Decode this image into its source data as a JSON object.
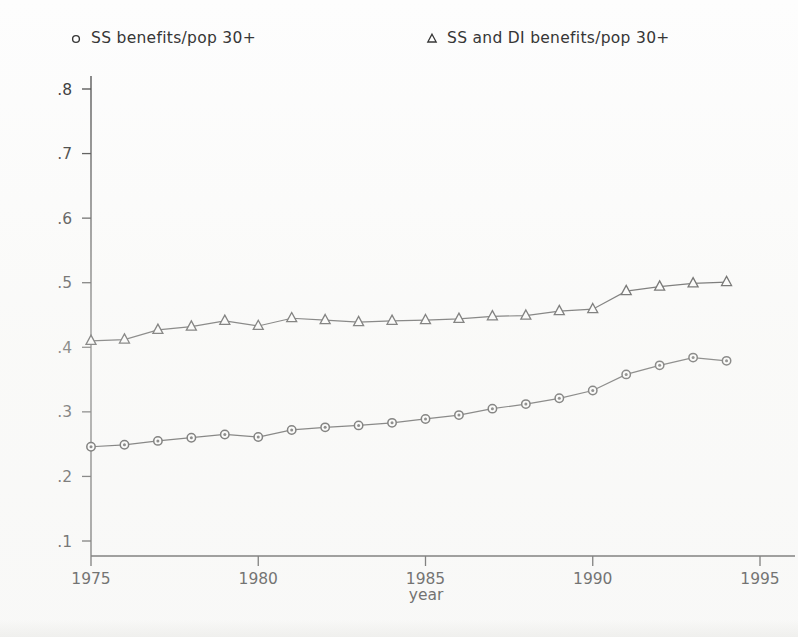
{
  "chart_data": {
    "type": "line",
    "title": "",
    "subtitle": "",
    "xlabel": "year",
    "ylabel": "",
    "xlim": [
      1975,
      1995
    ],
    "ylim": [
      0.1,
      0.8
    ],
    "grid": false,
    "legend_position": "top",
    "x_ticks": [
      "1975",
      "1980",
      "1985",
      "1990",
      "1995"
    ],
    "x_tick_values": [
      1975,
      1980,
      1985,
      1990,
      1995
    ],
    "y_ticks": [
      ".1",
      ".2",
      ".3",
      ".4",
      ".5",
      ".6",
      ".7",
      ".8"
    ],
    "y_tick_values": [
      0.1,
      0.2,
      0.3,
      0.4,
      0.5,
      0.6,
      0.7,
      0.8
    ],
    "x": [
      1975,
      1976,
      1977,
      1978,
      1979,
      1980,
      1981,
      1982,
      1983,
      1984,
      1985,
      1986,
      1987,
      1988,
      1989,
      1990,
      1991,
      1992,
      1993,
      1994
    ],
    "series": [
      {
        "name": "SS benefits/pop 30+",
        "marker": "circle",
        "values": [
          0.246,
          0.249,
          0.255,
          0.26,
          0.265,
          0.261,
          0.272,
          0.276,
          0.279,
          0.283,
          0.289,
          0.295,
          0.305,
          0.312,
          0.321,
          0.333,
          0.358,
          0.372,
          0.384,
          0.379
        ]
      },
      {
        "name": "SS and DI benefits/pop 30+",
        "marker": "triangle",
        "values": [
          0.41,
          0.412,
          0.427,
          0.432,
          0.441,
          0.433,
          0.445,
          0.442,
          0.439,
          0.441,
          0.442,
          0.444,
          0.448,
          0.449,
          0.456,
          0.459,
          0.487,
          0.494,
          0.499,
          0.501
        ]
      }
    ]
  },
  "legend": {
    "entries": [
      {
        "marker_icon": "open-circle-marker-icon",
        "label": "SS benefits/pop 30+"
      },
      {
        "marker_icon": "open-triangle-marker-icon",
        "label": "SS and DI benefits/pop 30+"
      }
    ]
  },
  "colors": {
    "line": "#2e2e2e",
    "axis": "#3a3a3a",
    "marker_fill": "#ffffff",
    "marker_stroke": "#242424",
    "background": "#fdfdfd",
    "text": "#262626"
  }
}
